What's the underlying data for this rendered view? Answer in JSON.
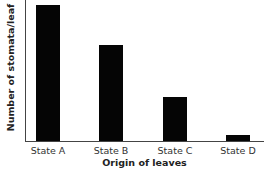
{
  "chart_data": {
    "type": "bar",
    "title": "",
    "xlabel": "Origin of leaves",
    "ylabel": "Number of stomata/leaf",
    "categories": [
      "State A",
      "State B",
      "State C",
      "State D"
    ],
    "values": [
      136,
      96,
      44,
      6
    ],
    "value_units": "relative (no numeric y-axis shown)",
    "grid": false,
    "legend": null,
    "bar_color": "#050505"
  }
}
